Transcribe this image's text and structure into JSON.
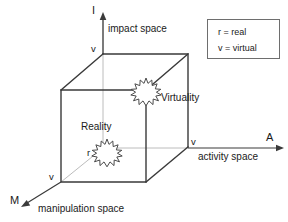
{
  "figure": {
    "background_color": "#ffffff",
    "line_color": "#333333",
    "axis_color": "#b8b8b8",
    "text_color": "#1a1a1a"
  },
  "axes": [
    {
      "id": "impact",
      "letter": "I",
      "name": "impact space",
      "direction": "up",
      "origin_mark": "v"
    },
    {
      "id": "activity",
      "letter": "A",
      "name": "activity space",
      "direction": "right",
      "origin_mark": "v"
    },
    {
      "id": "manipulation",
      "letter": "M",
      "name": "manipulation space",
      "direction": "down-left",
      "origin_mark": "v"
    }
  ],
  "markers": [
    {
      "id": "reality",
      "label": "Reality",
      "point_mark": "r",
      "shape": "starburst"
    },
    {
      "id": "virtuality",
      "label": "Virtuality",
      "point_mark": "",
      "shape": "starburst"
    }
  ],
  "legend": {
    "rows": [
      {
        "symbol": "r",
        "equals": "=",
        "meaning": "real",
        "text": "r = real"
      },
      {
        "symbol": "v",
        "equals": "=",
        "meaning": "virtual",
        "text": "v = virtual"
      }
    ]
  },
  "cube": {
    "description": "wireframe cube spanning the three spaces",
    "vertex_marks": [
      "v",
      "v",
      "v"
    ]
  }
}
